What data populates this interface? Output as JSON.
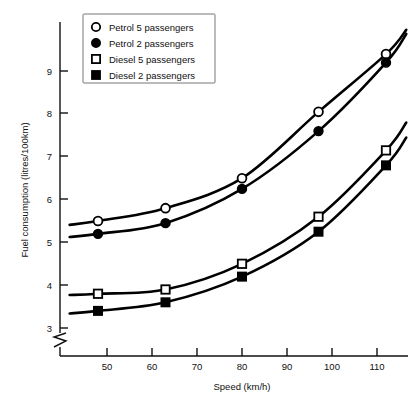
{
  "chart_data": {
    "type": "line",
    "title": "",
    "xlabel": "Speed (km/h)",
    "ylabel": "Fuel consumption (litres/100km)",
    "x": [
      48,
      63,
      80,
      97,
      112
    ],
    "xlim": [
      44,
      116
    ],
    "ylim": [
      2.8,
      9.75
    ],
    "xticks": [
      50,
      60,
      70,
      80,
      90,
      100,
      110
    ],
    "yticks": [
      3,
      4,
      5,
      6,
      7,
      8,
      9
    ],
    "grid": false,
    "axis_break": "y-axis break below 3",
    "legend_position": "top-left",
    "series": [
      {
        "name": "Petrol 5 passengers",
        "marker": "open-circle",
        "values": [
          5.5,
          5.8,
          6.5,
          8.05,
          9.4
        ]
      },
      {
        "name": "Petrol 2 passengers",
        "marker": "filled-circle",
        "values": [
          5.2,
          5.45,
          6.25,
          7.6,
          9.2
        ]
      },
      {
        "name": "Diesel 5 passengers",
        "marker": "open-square",
        "values": [
          3.8,
          3.9,
          4.5,
          5.6,
          7.15
        ]
      },
      {
        "name": "Diesel 2 passengers",
        "marker": "filled-square",
        "values": [
          3.4,
          3.6,
          4.2,
          5.25,
          6.8
        ]
      }
    ]
  },
  "axis": {
    "x_label": "Speed (km/h)",
    "y_label": "Fuel consumption (litres/100km)",
    "x_tick_labels": [
      "50",
      "60",
      "70",
      "80",
      "90",
      "100",
      "110"
    ],
    "y_tick_labels": [
      "3",
      "4",
      "5",
      "6",
      "7",
      "8",
      "9"
    ]
  },
  "legend": {
    "items": [
      {
        "label": "Petrol 5 passengers",
        "marker": "open-circle"
      },
      {
        "label": "Petrol 2 passengers",
        "marker": "filled-circle"
      },
      {
        "label": "Diesel 5 passengers",
        "marker": "open-square"
      },
      {
        "label": "Diesel 2 passengers",
        "marker": "filled-square"
      }
    ]
  },
  "colors": {
    "ink": "#000000",
    "axis": "#111111",
    "background": "#ffffff",
    "legend_border": "#777777"
  }
}
